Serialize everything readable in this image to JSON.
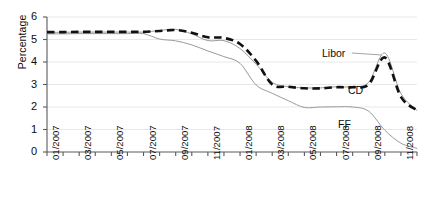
{
  "chart_data": {
    "type": "line",
    "title": "",
    "xlabel": "",
    "ylabel": "Percentage",
    "ylim": [
      0,
      6
    ],
    "yticks": [
      0,
      1,
      2,
      3,
      4,
      5,
      6
    ],
    "ytick_labels": [
      "0",
      "1",
      "2",
      "3",
      "4",
      "5",
      "6"
    ],
    "grid": true,
    "grid_axis": "y",
    "legend_position": "inline-annotations",
    "x": [
      "01/2007",
      "02/2007",
      "03/2007",
      "04/2007",
      "05/2007",
      "06/2007",
      "07/2007",
      "08/2007",
      "09/2007",
      "10/2007",
      "11/2007",
      "12/2007",
      "01/2008",
      "02/2008",
      "03/2008",
      "04/2008",
      "05/2008",
      "06/2008",
      "07/2008",
      "08/2008",
      "09/2008",
      "10/2008",
      "11/2008",
      "12/2008"
    ],
    "xtick_labels": [
      "01/2007",
      "03/2007",
      "05/2007",
      "07/2007",
      "09/2007",
      "11/2007",
      "01/2008",
      "03/2008",
      "05/2008",
      "07/2008",
      "09/2008",
      "11/2008"
    ],
    "xtick_label_interval": 2,
    "series": [
      {
        "name": "Libor",
        "style": "solid-thin-gray",
        "color": "#9a9a9a",
        "values": [
          5.32,
          5.32,
          5.33,
          5.33,
          5.33,
          5.33,
          5.33,
          5.4,
          5.45,
          5.25,
          4.95,
          4.95,
          4.6,
          3.9,
          3.1,
          2.9,
          2.85,
          2.85,
          2.9,
          2.9,
          3.1,
          4.4,
          2.6,
          1.85
        ]
      },
      {
        "name": "CD",
        "style": "dashed-thick-black",
        "color": "#111111",
        "values": [
          5.33,
          5.33,
          5.34,
          5.34,
          5.34,
          5.34,
          5.34,
          5.38,
          5.42,
          5.3,
          5.1,
          5.07,
          4.8,
          4.05,
          3.0,
          2.9,
          2.83,
          2.83,
          2.88,
          2.88,
          3.0,
          4.2,
          2.45,
          1.85
        ]
      },
      {
        "name": "FF",
        "style": "solid-thin-gray",
        "color": "#9a9a9a",
        "values": [
          5.25,
          5.25,
          5.26,
          5.26,
          5.26,
          5.26,
          5.26,
          5.02,
          4.94,
          4.76,
          4.49,
          4.24,
          3.94,
          2.98,
          2.61,
          2.28,
          1.98,
          2.0,
          2.01,
          2.0,
          1.81,
          0.97,
          0.39,
          0.16
        ]
      }
    ],
    "annotations": [
      {
        "text": "Libor",
        "series": "Libor"
      },
      {
        "text": "CD",
        "series": "CD"
      },
      {
        "text": "FF",
        "series": "FF"
      }
    ],
    "colors": {
      "axis": "#5a5a5a",
      "gridline": "#e8e8e8",
      "thin_line": "#9a9a9a",
      "thick_line": "#111111",
      "text": "#0d0d0d",
      "background": "#ffffff"
    }
  }
}
